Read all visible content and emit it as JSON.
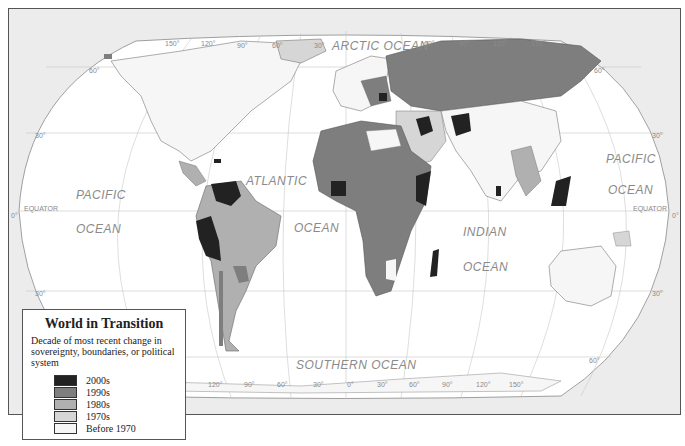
{
  "legend": {
    "title": "World in Transition",
    "description": "Decade of most recent change in sovereignty, boundaries, or political system",
    "items": [
      {
        "label": "2000s",
        "color": "#222222"
      },
      {
        "label": "1990s",
        "color": "#7e7e7e"
      },
      {
        "label": "1980s",
        "color": "#b0b0b0"
      },
      {
        "label": "1970s",
        "color": "#d6d6d6"
      },
      {
        "label": "Before 1970",
        "color": "#f6f6f6"
      }
    ]
  },
  "ocean_labels": {
    "arctic": "ARCTIC OCEAN",
    "pacific_west_1": "PACIFIC",
    "pacific_west_2": "OCEAN",
    "atlantic_1": "ATLANTIC",
    "atlantic_2": "OCEAN",
    "indian_1": "INDIAN",
    "indian_2": "OCEAN",
    "pacific_east_1": "PACIFIC",
    "pacific_east_2": "OCEAN",
    "southern": "SOUTHERN OCEAN"
  },
  "graticule_labels": {
    "equator_west": "EQUATOR",
    "equator_east": "EQUATOR",
    "lat_0_west": "0°",
    "lat_0_east": "0°",
    "lat_30n_west": "30°",
    "lat_30n_east": "30°",
    "lat_30s_west": "30°",
    "lat_30s_east": "30°",
    "lat_60n_west": "60°",
    "lat_60n_east": "60°",
    "lat_60s_east": "60°",
    "top_longitudes": [
      "150°",
      "120°",
      "90°",
      "60°",
      "30°",
      "60°",
      "90°",
      "120°",
      "150°"
    ],
    "bottom_longitudes": [
      "150°",
      "120°",
      "90°",
      "60°",
      "30°",
      "0°",
      "30°",
      "60°",
      "90°",
      "120°",
      "150°"
    ]
  }
}
